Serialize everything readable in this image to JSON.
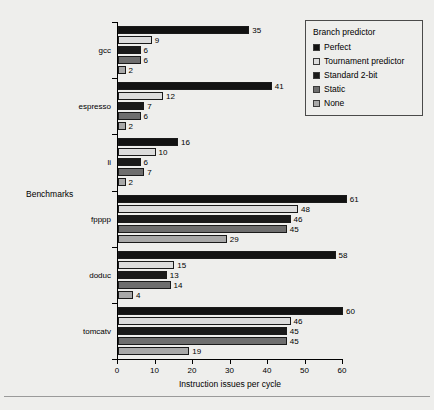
{
  "chart_data": {
    "type": "bar",
    "orientation": "horizontal",
    "title": "",
    "xlabel": "Instruction issues per cycle",
    "ylabel": "Benchmarks",
    "xlim": [
      0,
      60
    ],
    "xticks": [
      0,
      10,
      20,
      30,
      40,
      50,
      60
    ],
    "grid": false,
    "categories": [
      "gcc",
      "espresso",
      "li",
      "fpppp",
      "doduc",
      "tomcatv"
    ],
    "legend": {
      "title": "Branch predictor",
      "position": "top-right",
      "entries": [
        "Perfect",
        "Tournament predictor",
        "Standard 2-bit",
        "Static",
        "None"
      ]
    },
    "series": [
      {
        "name": "Perfect",
        "color": "#121212",
        "values": [
          35,
          41,
          16,
          61,
          58,
          60
        ]
      },
      {
        "name": "Tournament predictor",
        "color": "#dcdcdc",
        "values": [
          9,
          12,
          10,
          48,
          15,
          46
        ]
      },
      {
        "name": "Standard 2-bit",
        "color": "#1a1a1a",
        "values": [
          6,
          7,
          6,
          46,
          13,
          45
        ]
      },
      {
        "name": "Static",
        "color": "#6e6e6e",
        "values": [
          6,
          6,
          7,
          45,
          14,
          45
        ]
      },
      {
        "name": "None",
        "color": "#a8a8a8",
        "values": [
          2,
          2,
          2,
          29,
          4,
          19
        ]
      }
    ]
  }
}
